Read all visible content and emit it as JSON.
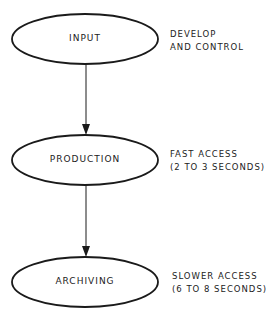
{
  "diagram": {
    "type": "flowchart",
    "nodes": [
      {
        "id": "input",
        "label": "INPUT",
        "note_line1": "DEVELOP",
        "note_line2": "AND CONTROL"
      },
      {
        "id": "production",
        "label": "PRODUCTION",
        "note_line1": "FAST ACCESS",
        "note_line2": "(2 TO 3 SECONDS)"
      },
      {
        "id": "archiving",
        "label": "ARCHIVING",
        "note_line1": "SLOWER ACCESS",
        "note_line2": "(6 TO 8 SECONDS)"
      }
    ],
    "edges": [
      {
        "from": "input",
        "to": "production"
      },
      {
        "from": "production",
        "to": "archiving"
      }
    ],
    "colors": {
      "stroke": "#1a1a1a",
      "background": "#ffffff"
    }
  }
}
